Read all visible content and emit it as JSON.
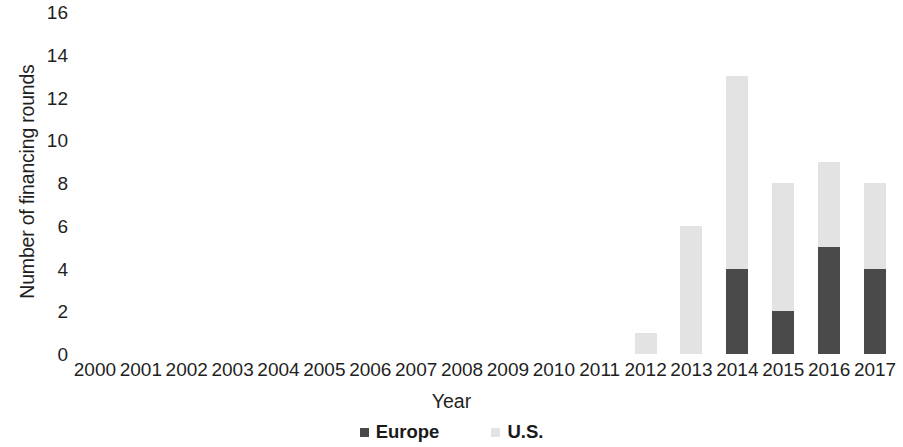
{
  "chart_data": {
    "type": "bar",
    "stacked": true,
    "title": "",
    "xlabel": "Year",
    "ylabel": "Number of financing rounds",
    "categories": [
      "2000",
      "2001",
      "2002",
      "2003",
      "2004",
      "2005",
      "2006",
      "2007",
      "2008",
      "2009",
      "2010",
      "2011",
      "2012",
      "2013",
      "2014",
      "2015",
      "2016",
      "2017"
    ],
    "series": [
      {
        "name": "Europe",
        "color": "#4a4a4a",
        "values": [
          0,
          0,
          0,
          0,
          0,
          0,
          0,
          0,
          0,
          0,
          0,
          0,
          0,
          0,
          4,
          2,
          5,
          4
        ]
      },
      {
        "name": "U.S.",
        "color": "#e3e3e3",
        "values": [
          0,
          0,
          0,
          0,
          0,
          0,
          0,
          0,
          0,
          0,
          0,
          0,
          1,
          6,
          9,
          6,
          4,
          4
        ]
      }
    ],
    "totals": [
      0,
      0,
      0,
      0,
      0,
      0,
      0,
      0,
      0,
      0,
      0,
      0,
      1,
      6,
      13,
      8,
      9,
      8
    ],
    "ylim": [
      0,
      16
    ],
    "ytick_step": 2,
    "yticks": [
      "0",
      "2",
      "4",
      "6",
      "8",
      "10",
      "12",
      "14",
      "16"
    ],
    "grid": false,
    "legend_position": "bottom"
  },
  "axes": {
    "y_title": "Number of financing rounds",
    "x_title": "Year"
  },
  "legend": {
    "items": [
      {
        "label": "Europe",
        "swatch": "legend-swatch-europe"
      },
      {
        "label": "U.S.",
        "swatch": "legend-swatch-us"
      }
    ]
  },
  "colors": {
    "europe": "#4a4a4a",
    "us": "#e3e3e3",
    "text": "#1f1f1f",
    "background": "#ffffff"
  }
}
